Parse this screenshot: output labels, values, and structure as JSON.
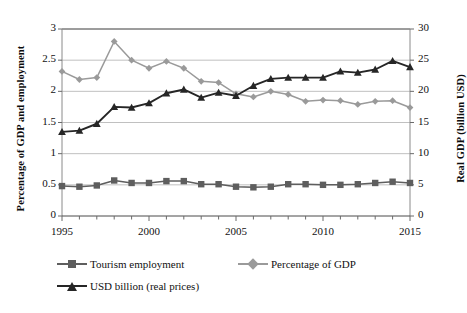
{
  "chart_data": {
    "type": "line",
    "title": "",
    "xlabel": "",
    "ylabel": "Percentage of GDP and employment",
    "y2label": "Real GDP (billion USD)",
    "x": [
      1995,
      1996,
      1997,
      1998,
      1999,
      2000,
      2001,
      2002,
      2003,
      2004,
      2005,
      2006,
      2007,
      2008,
      2009,
      2010,
      2011,
      2012,
      2013,
      2014,
      2015
    ],
    "xlim": [
      1995,
      2015
    ],
    "xticks": [
      1995,
      2000,
      2005,
      2010,
      2015
    ],
    "xtick_labels": [
      "1995",
      "2000",
      "2005",
      "2010",
      "2015"
    ],
    "xtick_interval_minor": 1,
    "ylim": [
      0,
      3
    ],
    "yticks": [
      0,
      0.5,
      1,
      1.5,
      2,
      2.5,
      3
    ],
    "ytick_labels": [
      "0",
      "0.5",
      "1",
      "1.5",
      "2",
      "2.5",
      "3"
    ],
    "y2lim": [
      0,
      30
    ],
    "y2ticks": [
      0,
      5,
      10,
      15,
      20,
      25,
      30
    ],
    "y2tick_labels": [
      "0",
      "5",
      "10",
      "15",
      "20",
      "25",
      "30"
    ],
    "grid": true,
    "grid_axis": "y",
    "legend_position": "bottom",
    "series": [
      {
        "name": "Tourism employment",
        "axis": "left",
        "color": "#5e5e5e",
        "marker": "square",
        "values": [
          0.48,
          0.47,
          0.49,
          0.57,
          0.53,
          0.53,
          0.56,
          0.56,
          0.51,
          0.51,
          0.47,
          0.46,
          0.47,
          0.51,
          0.51,
          0.5,
          0.5,
          0.51,
          0.53,
          0.55,
          0.53
        ]
      },
      {
        "name": "Percentage of GDP",
        "axis": "left",
        "color": "#9a9a9a",
        "marker": "diamond",
        "values": [
          2.32,
          2.19,
          2.22,
          2.8,
          2.5,
          2.37,
          2.48,
          2.37,
          2.16,
          2.14,
          1.96,
          1.91,
          2.0,
          1.95,
          1.84,
          1.86,
          1.85,
          1.79,
          1.84,
          1.85,
          1.74
        ]
      },
      {
        "name": "USD billion (real prices)",
        "axis": "right",
        "color": "#262626",
        "marker": "triangle",
        "values": [
          13.5,
          13.7,
          14.8,
          17.5,
          17.4,
          18.1,
          19.7,
          20.3,
          19.0,
          19.8,
          19.3,
          20.9,
          22.0,
          22.2,
          22.2,
          22.2,
          23.2,
          23.0,
          23.5,
          24.9,
          23.9
        ]
      }
    ]
  },
  "legend": {
    "items": [
      {
        "label": "Tourism employment"
      },
      {
        "label": "Percentage of GDP"
      },
      {
        "label": "USD billion (real prices)"
      }
    ]
  }
}
